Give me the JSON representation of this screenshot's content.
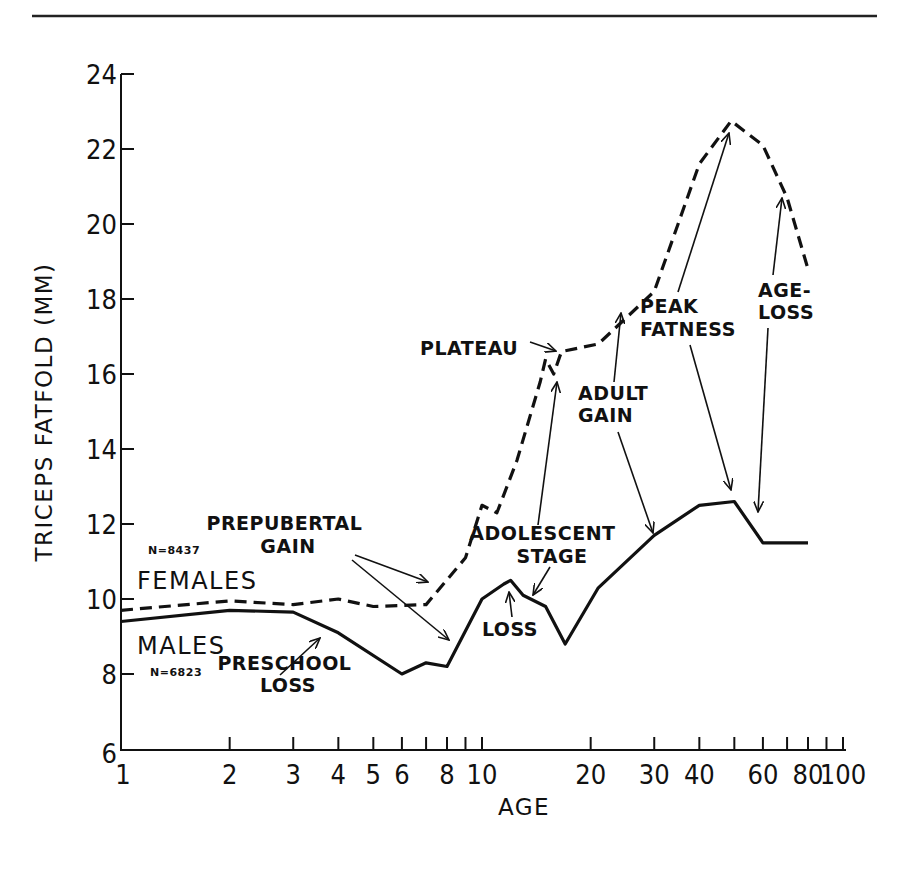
{
  "chart_data": {
    "type": "line",
    "title": "",
    "xlabel": "AGE",
    "ylabel": "TRICEPS FATFOLD (MM)",
    "xscale": "log",
    "xlim": [
      1,
      100
    ],
    "ylim": [
      6,
      24
    ],
    "grid": false,
    "x_tick_labels": [
      "1",
      "2",
      "3",
      "4",
      "5",
      "6",
      "8",
      "10",
      "20",
      "30",
      "40",
      "60",
      "80",
      "100"
    ],
    "x_minor_ticks": [
      2,
      3,
      4,
      5,
      6,
      7,
      8,
      9,
      10,
      20,
      30,
      40,
      50,
      60,
      70,
      80,
      90,
      100
    ],
    "y_ticks": [
      6,
      8,
      10,
      12,
      14,
      16,
      18,
      20,
      22,
      24
    ],
    "series": [
      {
        "name": "FEMALES",
        "n_label": "N=8437",
        "style": "dashed",
        "points": [
          [
            1,
            9.7
          ],
          [
            2,
            9.95
          ],
          [
            3,
            9.85
          ],
          [
            4,
            10.0
          ],
          [
            5,
            9.8
          ],
          [
            7,
            9.85
          ],
          [
            9,
            11.1
          ],
          [
            10,
            12.5
          ],
          [
            11,
            12.3
          ],
          [
            12.5,
            13.7
          ],
          [
            14.5,
            15.8
          ],
          [
            15,
            16.4
          ],
          [
            15.8,
            16.0
          ],
          [
            16.6,
            16.6
          ],
          [
            21,
            16.8
          ],
          [
            30,
            18.2
          ],
          [
            40,
            21.6
          ],
          [
            49,
            22.75
          ],
          [
            60,
            22.1
          ],
          [
            70,
            20.7
          ],
          [
            80,
            18.8
          ]
        ]
      },
      {
        "name": "MALES",
        "n_label": "N=6823",
        "style": "solid",
        "points": [
          [
            1,
            9.4
          ],
          [
            2,
            9.7
          ],
          [
            3,
            9.65
          ],
          [
            4,
            9.1
          ],
          [
            6,
            8.0
          ],
          [
            7,
            8.3
          ],
          [
            8,
            8.2
          ],
          [
            10,
            10.0
          ],
          [
            11.5,
            10.4
          ],
          [
            12,
            10.5
          ],
          [
            13,
            10.1
          ],
          [
            15,
            9.8
          ],
          [
            17,
            8.8
          ],
          [
            21,
            10.3
          ],
          [
            30,
            11.7
          ],
          [
            40,
            12.5
          ],
          [
            50,
            12.6
          ],
          [
            60,
            11.5
          ],
          [
            80,
            11.5
          ]
        ]
      }
    ],
    "annotations": [
      {
        "id": "prepubertal-gain",
        "lines": [
          "PREPUBERTAL",
          "GAIN"
        ],
        "text_xy": [
          223,
          530
        ]
      },
      {
        "id": "preschool-loss",
        "lines": [
          "PRESCHOOL",
          "LOSS"
        ],
        "text_xy": [
          232,
          692
        ]
      },
      {
        "id": "loss",
        "lines": [
          "LOSS"
        ],
        "text_xy": [
          483,
          636
        ]
      },
      {
        "id": "adolescent-stage",
        "lines": [
          "ADOLESCENT",
          "STAGE"
        ],
        "text_xy": [
          484,
          540
        ]
      },
      {
        "id": "plateau",
        "lines": [
          "PLATEAU"
        ],
        "text_xy": [
          420,
          355
        ]
      },
      {
        "id": "adult-gain",
        "lines": [
          "ADULT",
          "GAIN"
        ],
        "text_xy": [
          577,
          400
        ]
      },
      {
        "id": "peak-fatness",
        "lines": [
          "PEAK",
          "FATNESS"
        ],
        "text_xy": [
          641,
          312
        ]
      },
      {
        "id": "age-loss",
        "lines": [
          "AGE-",
          "LOSS"
        ],
        "text_xy": [
          758,
          297
        ]
      }
    ]
  },
  "labels": {
    "females": "FEMALES",
    "males": "MALES",
    "n_females": "N=8437",
    "n_males": "N=6823",
    "x_axis_title": "AGE",
    "y_axis_title": "TRICEPS FATFOLD (MM)"
  },
  "colors": {
    "ink": "#111111",
    "background": "#ffffff"
  }
}
